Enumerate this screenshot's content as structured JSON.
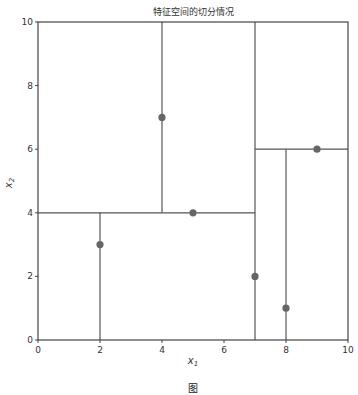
{
  "chart_data": {
    "type": "scatter",
    "title": "特征空间的切分情况",
    "xlabel": "x1",
    "ylabel": "x2",
    "xlim": [
      0,
      10
    ],
    "ylim": [
      0,
      10
    ],
    "grid": false,
    "xticks": [
      0,
      2,
      4,
      6,
      8,
      10
    ],
    "yticks": [
      0,
      2,
      4,
      6,
      8,
      10
    ],
    "points": [
      {
        "x": 2,
        "y": 3
      },
      {
        "x": 5,
        "y": 4
      },
      {
        "x": 9,
        "y": 6
      },
      {
        "x": 4,
        "y": 7
      },
      {
        "x": 8,
        "y": 1
      },
      {
        "x": 7,
        "y": 2
      }
    ],
    "split_lines": [
      {
        "orientation": "vertical",
        "x": 7,
        "y_from": 0,
        "y_to": 10
      },
      {
        "orientation": "horizontal",
        "y": 4,
        "x_from": 0,
        "x_to": 7
      },
      {
        "orientation": "horizontal",
        "y": 6,
        "x_from": 7,
        "x_to": 10
      },
      {
        "orientation": "vertical",
        "x": 2,
        "y_from": 0,
        "y_to": 4
      },
      {
        "orientation": "vertical",
        "x": 4,
        "y_from": 4,
        "y_to": 10
      },
      {
        "orientation": "vertical",
        "x": 8,
        "y_from": 0,
        "y_to": 6
      }
    ],
    "colors": {
      "points": "#666666",
      "lines": "#555555",
      "axes": "#444444"
    }
  },
  "caption": "图"
}
